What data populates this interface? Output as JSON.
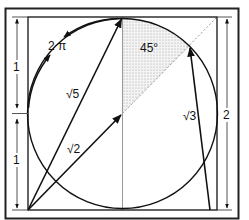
{
  "diagram": {
    "labels": {
      "two_pi": "2 π",
      "angle": "45°",
      "sqrt5": "√5",
      "sqrt2": "√2",
      "sqrt3": "√3",
      "left_upper_dim": "1",
      "left_lower_dim": "1",
      "right_dim": "2"
    },
    "colors": {
      "stroke": "#111111",
      "frame": "#222222",
      "guide": "#9a9a9a",
      "shade": "#bdbdbd",
      "background": "#ffffff"
    },
    "shapes": {
      "outer_frame": "rectangle",
      "inner_square": "square side 2",
      "circle": "inscribed circle radius 1",
      "shaded_sector": "45° sector",
      "diagonal": "dashed center-to-corner",
      "vertical_axis": "center vertical line"
    }
  }
}
